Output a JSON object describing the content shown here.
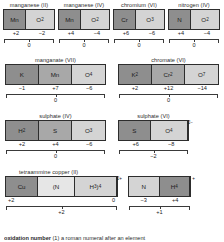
{
  "figure": {
    "footer_term": "oxidation number",
    "footer_text": " (1) a roman numeral after an element"
  },
  "species": [
    {
      "id": "manganese-ii",
      "caption": "manganese (II)",
      "cells": [
        {
          "label": "Mn",
          "sub": "",
          "shade": "dark",
          "width": 46
        },
        {
          "label": "O",
          "sub": "2",
          "shade": "light",
          "width": 54
        }
      ],
      "charge": "",
      "oxidation_numbers": [
        "+2",
        "−2"
      ],
      "sum": "0"
    },
    {
      "id": "manganese-iv",
      "caption": "manganese (IV)",
      "cells": [
        {
          "label": "Mn",
          "sub": "",
          "shade": "dark",
          "width": 46
        },
        {
          "label": "O",
          "sub": "2",
          "shade": "light",
          "width": 54
        }
      ],
      "charge": "",
      "oxidation_numbers": [
        "+4",
        "−4"
      ],
      "sum": "0"
    },
    {
      "id": "chromium-vi",
      "caption": "chromium (VI)",
      "cells": [
        {
          "label": "Cr",
          "sub": "",
          "shade": "dark",
          "width": 46
        },
        {
          "label": "O",
          "sub": "3",
          "shade": "light",
          "width": 54
        }
      ],
      "charge": "",
      "oxidation_numbers": [
        "+6",
        "−6"
      ],
      "sum": "0"
    },
    {
      "id": "nitrogen-iv",
      "caption": "nitrogen (IV)",
      "cells": [
        {
          "label": "N",
          "sub": "",
          "shade": "dark",
          "width": 46
        },
        {
          "label": "O",
          "sub": "2",
          "shade": "light",
          "width": 54
        }
      ],
      "charge": "",
      "oxidation_numbers": [
        "+4",
        "−4"
      ],
      "sum": "0"
    },
    {
      "id": "manganate-vii",
      "caption": "manganate (VII)",
      "cells": [
        {
          "label": "K",
          "sub": "",
          "shade": "dark",
          "width": 33
        },
        {
          "label": "Mn",
          "sub": "",
          "shade": "mid",
          "width": 34
        },
        {
          "label": "O",
          "sub": "4",
          "shade": "light",
          "width": 33
        }
      ],
      "charge": "",
      "oxidation_numbers": [
        "−1",
        "+7",
        "−6"
      ],
      "sum": "0"
    },
    {
      "id": "chromate-vi",
      "caption": "chromate (VI)",
      "cells": [
        {
          "label": "K",
          "sub": "2",
          "shade": "dark",
          "width": 33
        },
        {
          "label": "Cr",
          "sub": "2",
          "shade": "mid",
          "width": 34
        },
        {
          "label": "O",
          "sub": "7",
          "shade": "light",
          "width": 33
        }
      ],
      "charge": "",
      "oxidation_numbers": [
        "+2",
        "+12",
        "−14"
      ],
      "sum": "0"
    },
    {
      "id": "sulphate-iv",
      "caption": "sulphate (IV)",
      "cells": [
        {
          "label": "H",
          "sub": "2",
          "shade": "dark",
          "width": 33
        },
        {
          "label": "S",
          "sub": "",
          "shade": "mid",
          "width": 34
        },
        {
          "label": "O",
          "sub": "3",
          "shade": "light",
          "width": 33
        }
      ],
      "charge": "",
      "oxidation_numbers": [
        "+2",
        "+4",
        "−6"
      ],
      "sum": "0"
    },
    {
      "id": "sulphate-vi",
      "caption": "sulphate (VI)",
      "cells": [
        {
          "label": "S",
          "sub": "",
          "shade": "dark",
          "width": 33
        },
        {
          "label": "O",
          "sub": "4",
          "shade": "light",
          "width": 38
        }
      ],
      "charge": "2−",
      "oxidation_numbers": [
        "+6",
        "−8"
      ],
      "sum": "−2"
    },
    {
      "id": "tetraammine-copper-ii",
      "caption": "tetraammine copper (II)",
      "cells": [
        {
          "label": "Cu",
          "sub": "",
          "shade": "dark",
          "width": 40
        },
        {
          "label": "(N",
          "sub": "",
          "shade": "xlight",
          "width": 48
        },
        {
          "label": "H<sub>3</sub>)<sub>4</sub>",
          "sub": "",
          "shade": "light",
          "width": 52
        }
      ],
      "charge": "2+",
      "oxidation_numbers": [
        "+2",
        "0"
      ],
      "sum": "+2"
    },
    {
      "id": "ammonium",
      "caption": "",
      "cells": [
        {
          "label": "N",
          "sub": "",
          "shade": "light",
          "width": 33
        },
        {
          "label": "H",
          "sub": "4",
          "shade": "dark",
          "width": 33
        }
      ],
      "charge": "+",
      "oxidation_numbers": [
        "−3",
        "+4"
      ],
      "sum": "+1"
    }
  ]
}
